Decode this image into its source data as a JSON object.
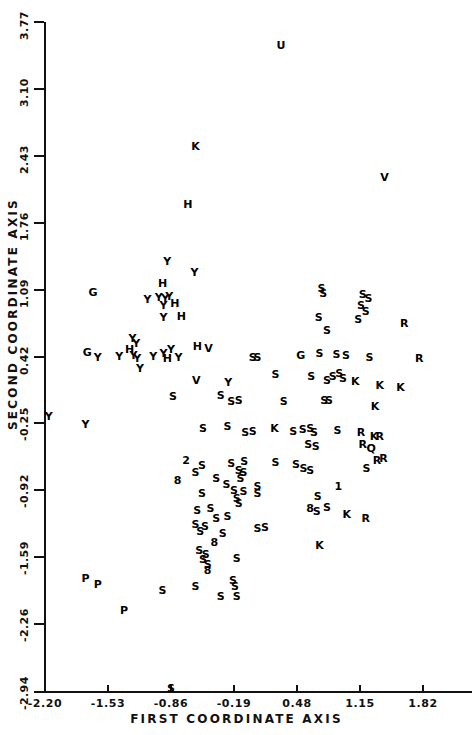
{
  "chart_data": {
    "type": "scatter",
    "title": "",
    "xlabel": "FIRST COORDINATE AXIS",
    "ylabel": "SECOND COORDINATE AXIS",
    "xlim": [
      -2.2,
      1.82
    ],
    "ylim": [
      -2.94,
      3.77
    ],
    "xticks": [
      "-2.20",
      "-1.53",
      "-0.86",
      "-0.19",
      "0.48",
      "1.15",
      "1.82"
    ],
    "xtick_values": [
      -2.2,
      -1.53,
      -0.86,
      -0.19,
      0.48,
      1.15,
      1.82
    ],
    "yticks": [
      "3.77",
      "3.10",
      "2.43",
      "1.76",
      "1.09",
      "0.42",
      "-0.25",
      "-0.92",
      "-1.59",
      "-2.26",
      "-2.94"
    ],
    "ytick_values": [
      3.77,
      3.1,
      2.43,
      1.76,
      1.09,
      0.42,
      -0.25,
      -0.92,
      -1.59,
      -2.26,
      -2.94
    ],
    "grid": false,
    "legend": "none",
    "marker_style": "text-labels",
    "group_labels": [
      "Y",
      "H",
      "G",
      "S",
      "K",
      "R",
      "V",
      "U",
      "P",
      "Q",
      "1",
      "2",
      "8"
    ],
    "points": [
      {
        "label": "U",
        "x": 0.31,
        "y": 3.54
      },
      {
        "label": "K",
        "x": -0.6,
        "y": 2.53
      },
      {
        "label": "V",
        "x": 1.41,
        "y": 2.22
      },
      {
        "label": "H",
        "x": -0.68,
        "y": 1.95
      },
      {
        "label": "Y",
        "x": -0.9,
        "y": 1.38
      },
      {
        "label": "Y",
        "x": -0.61,
        "y": 1.27
      },
      {
        "label": "H",
        "x": -0.95,
        "y": 1.16
      },
      {
        "label": "G",
        "x": -1.69,
        "y": 1.07
      },
      {
        "label": "Y",
        "x": -1.11,
        "y": 1.0
      },
      {
        "label": "Y",
        "x": -0.99,
        "y": 1.02
      },
      {
        "label": "Y",
        "x": -0.92,
        "y": 1.01
      },
      {
        "label": "Y",
        "x": -0.88,
        "y": 1.03
      },
      {
        "label": "H",
        "x": -0.82,
        "y": 0.96
      },
      {
        "label": "Y",
        "x": -0.94,
        "y": 0.94
      },
      {
        "label": "S",
        "x": 0.74,
        "y": 1.11
      },
      {
        "label": "S",
        "x": 0.76,
        "y": 1.06
      },
      {
        "label": "S",
        "x": 1.18,
        "y": 1.05
      },
      {
        "label": "S",
        "x": 1.24,
        "y": 1.01
      },
      {
        "label": "S",
        "x": 1.16,
        "y": 0.94
      },
      {
        "label": "S",
        "x": 1.21,
        "y": 0.88
      },
      {
        "label": "S",
        "x": 0.71,
        "y": 0.82
      },
      {
        "label": "S",
        "x": 1.13,
        "y": 0.8
      },
      {
        "label": "H",
        "x": -0.75,
        "y": 0.83
      },
      {
        "label": "Y",
        "x": -0.94,
        "y": 0.82
      },
      {
        "label": "S",
        "x": 0.8,
        "y": 0.69
      },
      {
        "label": "R",
        "x": 1.62,
        "y": 0.76
      },
      {
        "label": "Y",
        "x": -1.27,
        "y": 0.61
      },
      {
        "label": "Y",
        "x": -1.23,
        "y": 0.56
      },
      {
        "label": "G",
        "x": -1.75,
        "y": 0.47
      },
      {
        "label": "Y",
        "x": -1.64,
        "y": 0.42
      },
      {
        "label": "Y",
        "x": -1.41,
        "y": 0.43
      },
      {
        "label": "Y",
        "x": -1.26,
        "y": 0.44
      },
      {
        "label": "Y",
        "x": -1.22,
        "y": 0.4
      },
      {
        "label": "Y",
        "x": -1.05,
        "y": 0.43
      },
      {
        "label": "H",
        "x": -1.3,
        "y": 0.5
      },
      {
        "label": "Y",
        "x": -0.94,
        "y": 0.46
      },
      {
        "label": "Y",
        "x": -0.86,
        "y": 0.5
      },
      {
        "label": "H",
        "x": -0.9,
        "y": 0.4
      },
      {
        "label": "Y",
        "x": -0.78,
        "y": 0.42
      },
      {
        "label": "H",
        "x": -0.58,
        "y": 0.53
      },
      {
        "label": "Y",
        "x": -1.19,
        "y": 0.3
      },
      {
        "label": "V",
        "x": -0.46,
        "y": 0.51
      },
      {
        "label": "S",
        "x": 0.01,
        "y": 0.41
      },
      {
        "label": "S",
        "x": 0.06,
        "y": 0.41
      },
      {
        "label": "G",
        "x": 0.52,
        "y": 0.44
      },
      {
        "label": "S",
        "x": 0.72,
        "y": 0.46
      },
      {
        "label": "S",
        "x": 0.9,
        "y": 0.45
      },
      {
        "label": "S",
        "x": 1.0,
        "y": 0.44
      },
      {
        "label": "S",
        "x": 1.25,
        "y": 0.42
      },
      {
        "label": "R",
        "x": 1.78,
        "y": 0.4
      },
      {
        "label": "V",
        "x": -0.59,
        "y": 0.18
      },
      {
        "label": "Y",
        "x": -0.25,
        "y": 0.16
      },
      {
        "label": "S",
        "x": 0.25,
        "y": 0.24
      },
      {
        "label": "S",
        "x": 0.63,
        "y": 0.22
      },
      {
        "label": "S",
        "x": 0.8,
        "y": 0.18
      },
      {
        "label": "S",
        "x": 0.86,
        "y": 0.22
      },
      {
        "label": "S",
        "x": 0.93,
        "y": 0.25
      },
      {
        "label": "S",
        "x": 0.97,
        "y": 0.2
      },
      {
        "label": "K",
        "x": 1.1,
        "y": 0.17
      },
      {
        "label": "K",
        "x": 1.36,
        "y": 0.13
      },
      {
        "label": "K",
        "x": 1.58,
        "y": 0.11
      },
      {
        "label": "S",
        "x": -0.84,
        "y": 0.02
      },
      {
        "label": "S",
        "x": -0.33,
        "y": 0.03
      },
      {
        "label": "S",
        "x": -0.22,
        "y": -0.03
      },
      {
        "label": "S",
        "x": -0.14,
        "y": -0.02
      },
      {
        "label": "S",
        "x": 0.34,
        "y": -0.03
      },
      {
        "label": "S",
        "x": 0.77,
        "y": -0.02
      },
      {
        "label": "S",
        "x": 0.82,
        "y": -0.02
      },
      {
        "label": "K",
        "x": 1.31,
        "y": -0.08
      },
      {
        "label": "Y",
        "x": -2.16,
        "y": -0.18
      },
      {
        "label": "Y",
        "x": -1.77,
        "y": -0.26
      },
      {
        "label": "S",
        "x": -0.52,
        "y": -0.3
      },
      {
        "label": "S",
        "x": -0.26,
        "y": -0.28
      },
      {
        "label": "S",
        "x": -0.07,
        "y": -0.34
      },
      {
        "label": "S",
        "x": 0.01,
        "y": -0.33
      },
      {
        "label": "K",
        "x": 0.24,
        "y": -0.3
      },
      {
        "label": "S",
        "x": 0.44,
        "y": -0.33
      },
      {
        "label": "S",
        "x": 0.54,
        "y": -0.31
      },
      {
        "label": "S",
        "x": 0.62,
        "y": -0.3
      },
      {
        "label": "S",
        "x": 0.66,
        "y": -0.34
      },
      {
        "label": "S",
        "x": 0.91,
        "y": -0.32
      },
      {
        "label": "R",
        "x": 1.16,
        "y": -0.34
      },
      {
        "label": "K",
        "x": 1.3,
        "y": -0.38
      },
      {
        "label": "R",
        "x": 1.36,
        "y": -0.38
      },
      {
        "label": "S",
        "x": 0.6,
        "y": -0.46
      },
      {
        "label": "S",
        "x": 0.68,
        "y": -0.48
      },
      {
        "label": "Q",
        "x": 1.27,
        "y": -0.5
      },
      {
        "label": "R",
        "x": 1.18,
        "y": -0.46
      },
      {
        "label": "2",
        "x": -0.7,
        "y": -0.62
      },
      {
        "label": "S",
        "x": -0.53,
        "y": -0.67
      },
      {
        "label": "S",
        "x": -0.22,
        "y": -0.65
      },
      {
        "label": "S",
        "x": -0.08,
        "y": -0.63
      },
      {
        "label": "S",
        "x": -0.14,
        "y": -0.72
      },
      {
        "label": "S",
        "x": -0.09,
        "y": -0.74
      },
      {
        "label": "S",
        "x": 0.25,
        "y": -0.64
      },
      {
        "label": "S",
        "x": 0.47,
        "y": -0.66
      },
      {
        "label": "S",
        "x": 0.55,
        "y": -0.7
      },
      {
        "label": "S",
        "x": 0.62,
        "y": -0.72
      },
      {
        "label": "R",
        "x": 1.33,
        "y": -0.62
      },
      {
        "label": "R",
        "x": 1.4,
        "y": -0.6
      },
      {
        "label": "S",
        "x": 1.22,
        "y": -0.7
      },
      {
        "label": "S",
        "x": -0.6,
        "y": -0.74
      },
      {
        "label": "8",
        "x": -0.79,
        "y": -0.82
      },
      {
        "label": "S",
        "x": -0.38,
        "y": -0.8
      },
      {
        "label": "S",
        "x": -0.27,
        "y": -0.86
      },
      {
        "label": "S",
        "x": -0.12,
        "y": -0.8
      },
      {
        "label": "S",
        "x": -0.19,
        "y": -0.92
      },
      {
        "label": "S",
        "x": -0.09,
        "y": -0.93
      },
      {
        "label": "S",
        "x": 0.06,
        "y": -0.88
      },
      {
        "label": "S",
        "x": 0.06,
        "y": -0.95
      },
      {
        "label": "1",
        "x": 0.92,
        "y": -0.88
      },
      {
        "label": "S",
        "x": -0.53,
        "y": -0.95
      },
      {
        "label": "S",
        "x": -0.16,
        "y": -1.0
      },
      {
        "label": "S",
        "x": -0.14,
        "y": -1.05
      },
      {
        "label": "S",
        "x": 0.7,
        "y": -0.98
      },
      {
        "label": "8",
        "x": 0.62,
        "y": -1.1
      },
      {
        "label": "S",
        "x": 0.69,
        "y": -1.13
      },
      {
        "label": "S",
        "x": 0.8,
        "y": -1.09
      },
      {
        "label": "R",
        "x": 1.21,
        "y": -1.2
      },
      {
        "label": "K",
        "x": 1.01,
        "y": -1.16
      },
      {
        "label": "S",
        "x": -0.58,
        "y": -1.12
      },
      {
        "label": "S",
        "x": -0.44,
        "y": -1.1
      },
      {
        "label": "S",
        "x": -0.38,
        "y": -1.2
      },
      {
        "label": "S",
        "x": -0.26,
        "y": -1.18
      },
      {
        "label": "S",
        "x": -0.6,
        "y": -1.26
      },
      {
        "label": "S",
        "x": -0.5,
        "y": -1.28
      },
      {
        "label": "S",
        "x": -0.55,
        "y": -1.33
      },
      {
        "label": "S",
        "x": -0.31,
        "y": -1.35
      },
      {
        "label": "S",
        "x": 0.06,
        "y": -1.3
      },
      {
        "label": "S",
        "x": 0.14,
        "y": -1.29
      },
      {
        "label": "8",
        "x": -0.4,
        "y": -1.44
      },
      {
        "label": "K",
        "x": 0.72,
        "y": -1.47
      },
      {
        "label": "S",
        "x": -0.56,
        "y": -1.52
      },
      {
        "label": "S",
        "x": -0.49,
        "y": -1.56
      },
      {
        "label": "S",
        "x": -0.52,
        "y": -1.61
      },
      {
        "label": "S",
        "x": -0.47,
        "y": -1.66
      },
      {
        "label": "8",
        "x": -0.47,
        "y": -1.72
      },
      {
        "label": "S",
        "x": -0.16,
        "y": -1.6
      },
      {
        "label": "P",
        "x": -1.77,
        "y": -1.8
      },
      {
        "label": "P",
        "x": -1.64,
        "y": -1.86
      },
      {
        "label": "S",
        "x": -0.95,
        "y": -1.92
      },
      {
        "label": "S",
        "x": -0.6,
        "y": -1.88
      },
      {
        "label": "S",
        "x": -0.2,
        "y": -1.82
      },
      {
        "label": "S",
        "x": -0.18,
        "y": -1.88
      },
      {
        "label": "S",
        "x": -0.33,
        "y": -1.98
      },
      {
        "label": "S",
        "x": -0.16,
        "y": -1.98
      },
      {
        "label": "P",
        "x": -1.36,
        "y": -2.12
      },
      {
        "label": "S",
        "x": -0.86,
        "y": -2.9
      }
    ]
  },
  "plot": {
    "axis_title_y": "SECOND COORDINATE AXIS",
    "axis_title_x": "FIRST COORDINATE AXIS"
  }
}
